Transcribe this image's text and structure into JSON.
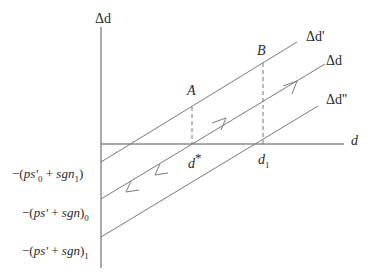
{
  "diagram": {
    "type": "phase-line diagram",
    "colors": {
      "axis": "#555555",
      "line": "#7a7a7a",
      "text": "#2a2a2a",
      "background": "#ffffff"
    },
    "axes": {
      "y_label": "Δd",
      "x_label": "d"
    },
    "lines": [
      {
        "id": "delta-d-prime",
        "label": "Δd'"
      },
      {
        "id": "delta-d",
        "label": "Δd"
      },
      {
        "id": "delta-d-double-prime",
        "label": "Δd''"
      }
    ],
    "points": [
      {
        "id": "A",
        "label": "A"
      },
      {
        "id": "B",
        "label": "B"
      }
    ],
    "x_ticks": [
      {
        "id": "d-star",
        "base": "d",
        "sup": "*"
      },
      {
        "id": "d-1",
        "base": "d",
        "sub": "1"
      }
    ],
    "y_intercepts": [
      {
        "id": "intercept-1",
        "pre": "−(",
        "a": "ps'",
        "a_sub": "0",
        "mid": " + ",
        "b": "sgn",
        "b_sub": "1",
        "post": ")"
      },
      {
        "id": "intercept-2",
        "pre": "−(",
        "a": "ps'",
        "mid": " + ",
        "b": "sgn",
        "post": ")",
        "post_sub": "0"
      },
      {
        "id": "intercept-3",
        "pre": "−(",
        "a": "ps'",
        "mid": " + ",
        "b": "sgn",
        "post": ")",
        "post_sub": "1"
      }
    ]
  }
}
